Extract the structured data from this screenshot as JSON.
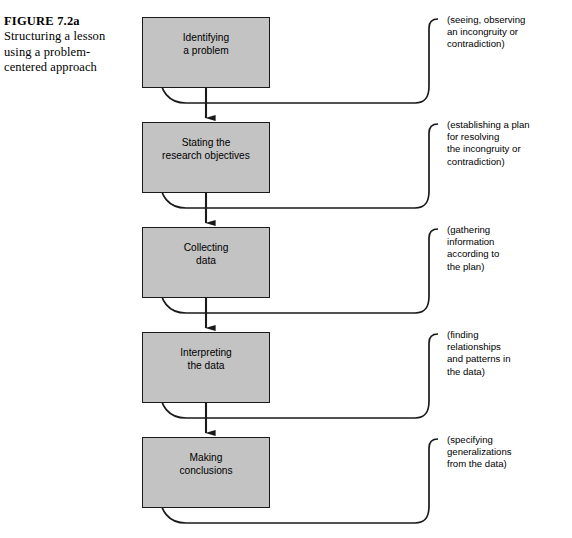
{
  "caption": {
    "figure_label": "FIGURE 7.2a",
    "description": "Structuring a lesson using a problem-centered approach"
  },
  "diagram": {
    "title": "Structuring a lesson using a problem-centered approach",
    "box_fill_color": "#c3c3c3",
    "box_border_color": "#1a1a1a",
    "line_color": "#1a1a1a",
    "stages": [
      {
        "id": "identifying-a-problem",
        "label": "Identifying\na problem",
        "annotation": "(seeing, observing\nan incongruity or\ncontradiction)"
      },
      {
        "id": "stating-the-research-objectives",
        "label": "Stating the\nresearch objectives",
        "annotation": "(establishing a plan\nfor resolving\nthe  incongruity or\ncontradiction)"
      },
      {
        "id": "collecting-data",
        "label": "Collecting\ndata",
        "annotation": "(gathering\ninformation\naccording to\nthe plan)"
      },
      {
        "id": "interpreting-the-data",
        "label": "Interpreting\nthe data",
        "annotation": "(finding\nrelationships\nand patterns in\nthe  data)"
      },
      {
        "id": "making-conclusions",
        "label": "Making\nconclusions",
        "annotation": "(specifying\ngeneralizations\nfrom the data)"
      }
    ]
  }
}
